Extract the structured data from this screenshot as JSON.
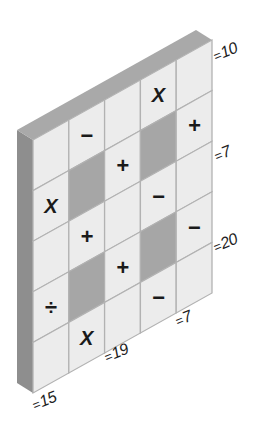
{
  "puzzle": {
    "type": "arithmetic-grid-puzzle",
    "rows": 5,
    "cols": 5,
    "colors": {
      "cell": "#ececec",
      "dark_cell": "#a6a6a6",
      "grid_line": "#b2b2b2",
      "top_face": "#a9a9a9",
      "side_face": "#8e8e8e",
      "symbol": "#1a1a1a"
    },
    "cells": [
      [
        "",
        "−",
        "",
        "X",
        ""
      ],
      [
        "X",
        "#",
        "+",
        "#",
        "+"
      ],
      [
        "",
        "+",
        "",
        "−",
        ""
      ],
      [
        "÷",
        "#",
        "+",
        "#",
        "−"
      ],
      [
        "",
        "X",
        "",
        "−",
        ""
      ]
    ],
    "legend": {
      "#": "shaded cell"
    },
    "row_results": [
      {
        "row": 0,
        "text": "10"
      },
      {
        "row": 2,
        "text": "7"
      },
      {
        "row": 4,
        "text": "20"
      }
    ],
    "col_results": [
      {
        "col": 0,
        "text": "15"
      },
      {
        "col": 2,
        "text": "19"
      },
      {
        "col": 4,
        "text": "7"
      }
    ],
    "equals_sign": "="
  }
}
